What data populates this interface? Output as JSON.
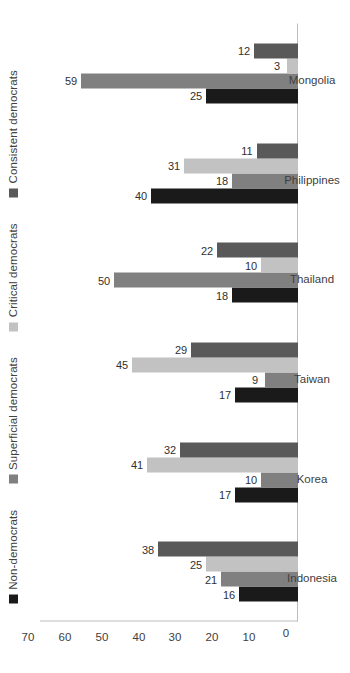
{
  "chart_data": {
    "type": "bar",
    "title": "",
    "xlabel": "",
    "ylabel": "",
    "ylim": [
      0,
      70
    ],
    "ytick_labels": [
      "0",
      "10",
      "20",
      "30",
      "40",
      "50",
      "60",
      "70"
    ],
    "ytick_values": [
      0,
      10,
      20,
      30,
      40,
      50,
      60,
      70
    ],
    "grid": false,
    "legend_position": "top",
    "orientation": "rotated-90",
    "categories": [
      "Indonesia",
      "Korea",
      "Taiwan",
      "Thailand",
      "Philippines",
      "Mongolia"
    ],
    "series": [
      {
        "name": "Consistent democrats",
        "color": "#595959",
        "values": [
          38,
          32,
          29,
          22,
          11,
          12
        ]
      },
      {
        "name": "Critical democrats",
        "color": "#c2c2c2",
        "values": [
          25,
          41,
          45,
          10,
          31,
          3
        ]
      },
      {
        "name": "Superficial democrats",
        "color": "#808080",
        "values": [
          21,
          10,
          9,
          50,
          18,
          59
        ]
      },
      {
        "name": "Non-democrats",
        "color": "#1a1a1a",
        "values": [
          16,
          17,
          17,
          18,
          40,
          25
        ]
      }
    ]
  },
  "caption": ""
}
